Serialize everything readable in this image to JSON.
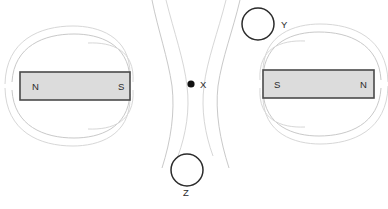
{
  "figure": {
    "background_color": "#ffffff",
    "width": 388,
    "height": 209
  },
  "colors": {
    "magnet_fill": "#dcdcdc",
    "magnet_border": "#4a4a4a",
    "field_line": "#c9c9c9",
    "field_line_faint": "#d7d7d7",
    "label_text": "#2b2b2b",
    "dot_fill": "#111111",
    "circle_stroke": "#2b2b2b"
  },
  "magnets": [
    {
      "id": "left-magnet",
      "x": 20,
      "y": 72,
      "width": 110,
      "height": 28,
      "left_pole_label": "N",
      "right_pole_label": "S",
      "left_label_x": 32,
      "right_label_x": 118,
      "label_y": 90
    },
    {
      "id": "right-magnet",
      "x": 263,
      "y": 70,
      "width": 111,
      "height": 28,
      "left_pole_label": "S",
      "right_pole_label": "N",
      "left_label_x": 274,
      "right_label_x": 360,
      "label_y": 88
    }
  ],
  "markers": [
    {
      "id": "marker-x",
      "label": "X",
      "type": "dot",
      "cx": 191,
      "cy": 84,
      "r": 3.6,
      "label_x": 200,
      "label_y": 88
    },
    {
      "id": "marker-y",
      "label": "Y",
      "type": "circle",
      "cx": 258,
      "cy": 24,
      "r": 16,
      "label_x": 281,
      "label_y": 28
    },
    {
      "id": "marker-z",
      "label": "Z",
      "type": "circle",
      "cx": 187,
      "cy": 170,
      "r": 16,
      "label_x": 183,
      "label_y": 196
    }
  ],
  "field_lines": {
    "left_loops": [
      "M 130 78 C 128 44, 100 34, 74 34 C 44 34, 14 46, 12 82",
      "M 130 74 C 130 36, 98 26, 73 26 C 40 26, 6 40, 5 84",
      "M 133 82 C 135 50, 112 42, 88 43",
      "M 130 94 C 128 128, 100 138, 74 138 C 44 138, 14 126, 12 90",
      "M 130 98 C 130 136, 98 146, 73 146 C 40 146, 6 132, 5 88",
      "M 133 90 C 135 122, 112 130, 88 129"
    ],
    "right_loops": [
      "M 263 76 C 265 42, 293 32, 319 32 C 349 32, 379 44, 381 80",
      "M 263 72 C 263 34, 295 24, 320 24 C 353 24, 387 38, 388 82",
      "M 260 80 C 258 48, 281 40, 305 41",
      "M 263 92 C 265 126, 293 136, 319 136 C 349 136, 379 124, 381 88",
      "M 263 96 C 263 134, 295 144, 320 144 C 353 144, 387 130, 388 86",
      "M 260 88 C 258 120, 281 128, 305 127"
    ],
    "center_repulsion": [
      "M 152 0 C 158 30, 168 58, 172 86 C 175 112, 171 140, 162 168",
      "M 166 0 C 174 32, 184 60, 187 86 C 190 110, 186 134, 178 156",
      "M 240 0 C 233 30, 222 58, 218 86 C 215 112, 220 140, 229 168",
      "M 226 0 C 218 32, 207 60, 204 86 C 201 110, 205 134, 213 156"
    ]
  }
}
